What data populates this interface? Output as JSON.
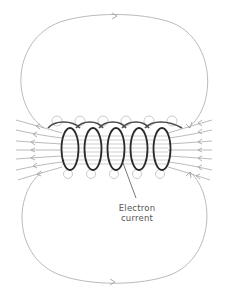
{
  "diagram": {
    "label": {
      "line1": "Electron",
      "line2": "current"
    },
    "colors": {
      "coil": "#2a2a2a",
      "field_lines": "#a8a8a8",
      "label_text": "#555555",
      "background": "#ffffff"
    },
    "components": {
      "coil_turns": 5,
      "field_loop_top": "closed oval loop above coil, arrow pointing right",
      "field_loop_bottom": "closed oval loop below coil, arrow pointing right",
      "end_field_lines": "lines fanning from both coil ends with arrows pointing left",
      "wire_field_circles": "small circles around each wire crossing above and below the coil"
    }
  }
}
